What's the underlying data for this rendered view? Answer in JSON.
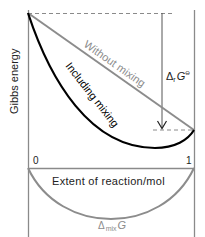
{
  "diagram": {
    "y_axis_label": "Gibbs energy",
    "x_axis_label": "Extent of reaction/mol",
    "x_tick_start": "0",
    "x_tick_end": "1",
    "line_without_mixing_label": "Without mixing",
    "curve_including_mixing_label": "Including mixing",
    "arrow_label_main": "Δ",
    "arrow_label_sub": "r",
    "arrow_label_symbol": "G",
    "arrow_label_sup": "⊖",
    "mix_label_main": "Δ",
    "mix_label_sub": "mix",
    "mix_label_symbol": "G",
    "colors": {
      "axis": "#8a8a8a",
      "without_mixing": "#8c8c8c",
      "including_mixing": "#000000",
      "mix_curve": "#8c8c8c",
      "dashed": "#8a8a8a",
      "text": "#222222",
      "gray_text": "#8c8c8c"
    }
  }
}
